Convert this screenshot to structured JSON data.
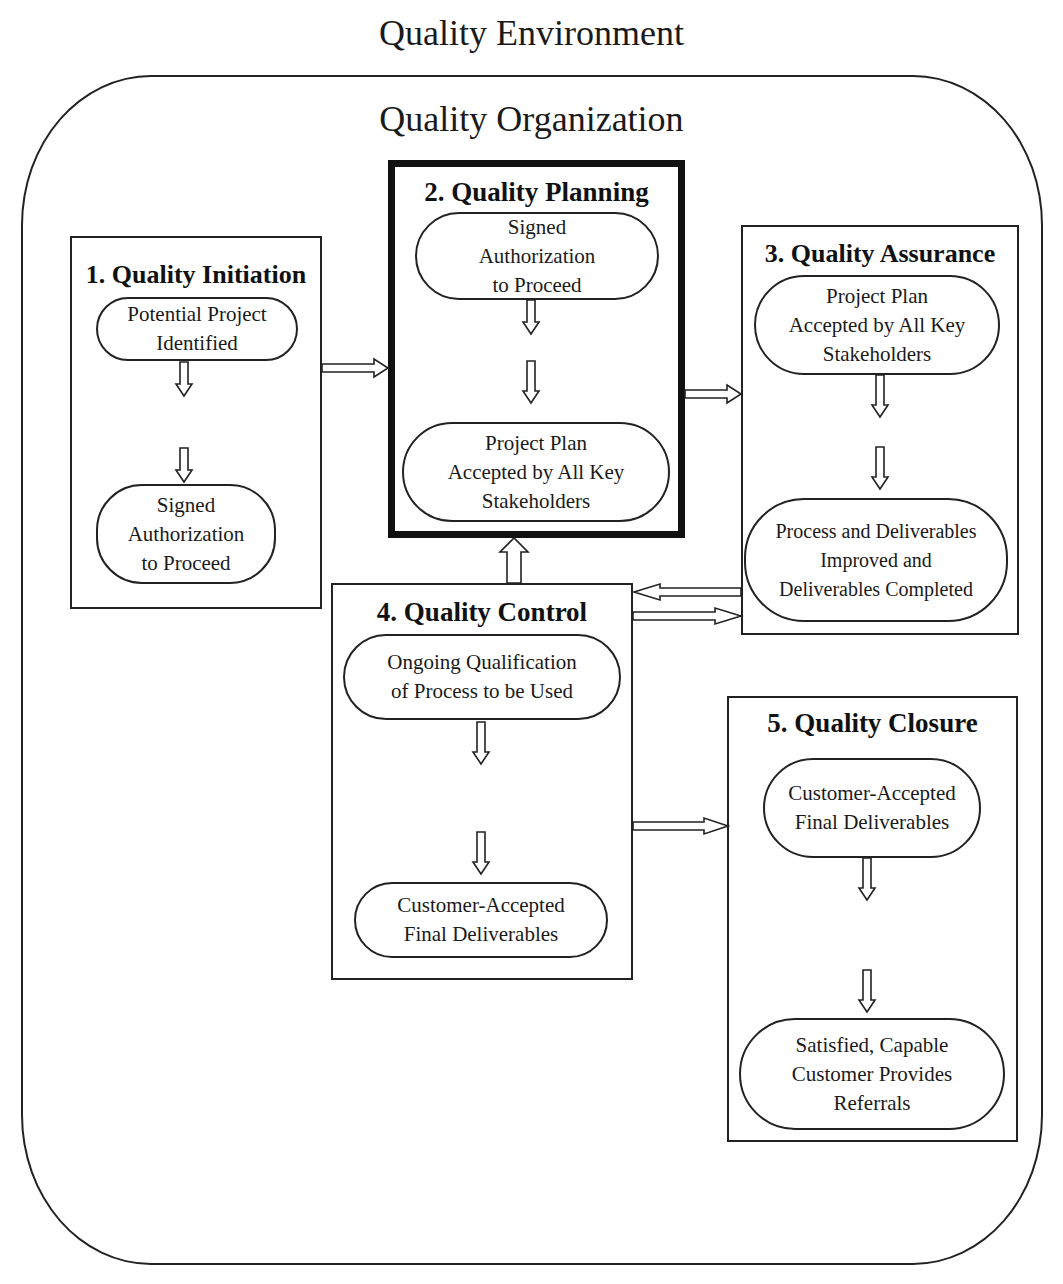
{
  "diagram": {
    "title": "Quality Environment",
    "organization_label": "Quality Organization",
    "stages": [
      {
        "number": "1.",
        "title": "1.  Quality Initiation",
        "steps": [
          {
            "lines": [
              "Potential Project",
              "Identified"
            ]
          },
          {
            "lines": [
              "Signed",
              "Authorization",
              "to Proceed"
            ]
          }
        ]
      },
      {
        "number": "2.",
        "title": "2.  Quality Planning",
        "emphasized": true,
        "steps": [
          {
            "lines": [
              "Signed",
              "Authorization",
              "to Proceed"
            ]
          },
          {
            "lines": [
              "Project Plan",
              "Accepted by All Key",
              "Stakeholders"
            ]
          }
        ]
      },
      {
        "number": "3.",
        "title": "3.  Quality Assurance",
        "steps": [
          {
            "lines": [
              "Project Plan",
              "Accepted by All Key",
              "Stakeholders"
            ]
          },
          {
            "lines": [
              "Process and Deliverables",
              "Improved and",
              "Deliverables Completed"
            ]
          }
        ]
      },
      {
        "number": "4.",
        "title": "4.  Quality Control",
        "steps": [
          {
            "lines": [
              "Ongoing Qualification",
              "of Process to be Used"
            ]
          },
          {
            "lines": [
              "Customer-Accepted",
              "Final Deliverables"
            ]
          }
        ]
      },
      {
        "number": "5.",
        "title": "5.  Quality Closure",
        "steps": [
          {
            "lines": [
              "Customer-Accepted",
              "Final Deliverables"
            ]
          },
          {
            "lines": [
              "Satisfied, Capable",
              "Customer Provides",
              "Referrals"
            ]
          }
        ]
      }
    ],
    "connections": [
      {
        "from": "Quality Initiation",
        "to": "Quality Planning"
      },
      {
        "from": "Quality Planning",
        "to": "Quality Assurance"
      },
      {
        "from": "Quality Control",
        "to": "Quality Planning"
      },
      {
        "from": "Quality Assurance",
        "to": "Quality Control"
      },
      {
        "from": "Quality Control",
        "to": "Quality Assurance"
      },
      {
        "from": "Quality Control",
        "to": "Quality Closure"
      }
    ],
    "colors": {
      "line": "#222222",
      "background": "#ffffff",
      "text": "#111111"
    }
  }
}
